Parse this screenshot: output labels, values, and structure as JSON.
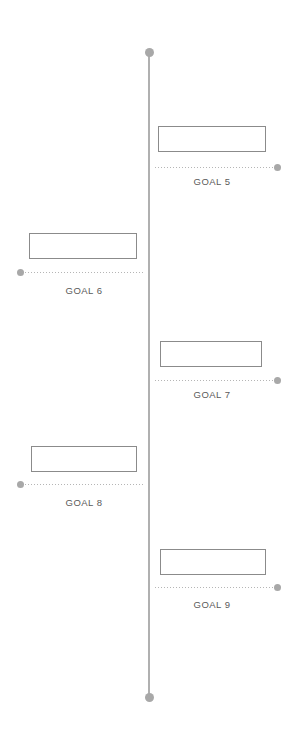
{
  "diagram": {
    "type": "vertical-timeline-roadmap",
    "width": 295,
    "height": 749,
    "background_color": "#ffffff",
    "axis": {
      "name": "timeline-axis",
      "x": 149,
      "top_y": 52,
      "bottom_y": 697,
      "line_width": 2,
      "line_color": "#b0b0b0",
      "cap_diameter": 9,
      "cap_color": "#a8a8a8"
    },
    "style": {
      "box_border_color": "#8b8b8b",
      "box_fill_color": "#ffffff",
      "connector_color": "#b5b5b5",
      "end_dot_color": "#a8a8a8",
      "label_color": "#5a5a5a"
    },
    "milestones": [
      {
        "label": "GOAL 5",
        "side": "right",
        "box": {
          "x": 158,
          "y": 126,
          "width": 108,
          "height": 26
        },
        "connector": {
          "x": 155,
          "y": 167,
          "width": 119
        },
        "end_dot": {
          "x": 274,
          "y": 164
        },
        "label_pos": {
          "center_x": 212,
          "y": 176
        }
      },
      {
        "label": "GOAL 6",
        "side": "left",
        "box": {
          "x": 29,
          "y": 233,
          "width": 108,
          "height": 26
        },
        "connector": {
          "x": 22,
          "y": 272,
          "width": 122
        },
        "end_dot": {
          "x": 17,
          "y": 269
        },
        "label_pos": {
          "center_x": 84,
          "y": 285
        }
      },
      {
        "label": "GOAL 7",
        "side": "right",
        "box": {
          "x": 160,
          "y": 341,
          "width": 102,
          "height": 26
        },
        "connector": {
          "x": 155,
          "y": 380,
          "width": 119
        },
        "end_dot": {
          "x": 274,
          "y": 377
        },
        "label_pos": {
          "center_x": 212,
          "y": 389
        }
      },
      {
        "label": "GOAL 8",
        "side": "left",
        "box": {
          "x": 31,
          "y": 446,
          "width": 106,
          "height": 26
        },
        "connector": {
          "x": 22,
          "y": 484,
          "width": 122
        },
        "end_dot": {
          "x": 17,
          "y": 481
        },
        "label_pos": {
          "center_x": 84,
          "y": 497
        }
      },
      {
        "label": "GOAL 9",
        "side": "right",
        "box": {
          "x": 160,
          "y": 549,
          "width": 106,
          "height": 26
        },
        "connector": {
          "x": 155,
          "y": 587,
          "width": 119
        },
        "end_dot": {
          "x": 274,
          "y": 584
        },
        "label_pos": {
          "center_x": 212,
          "y": 599
        }
      }
    ]
  }
}
